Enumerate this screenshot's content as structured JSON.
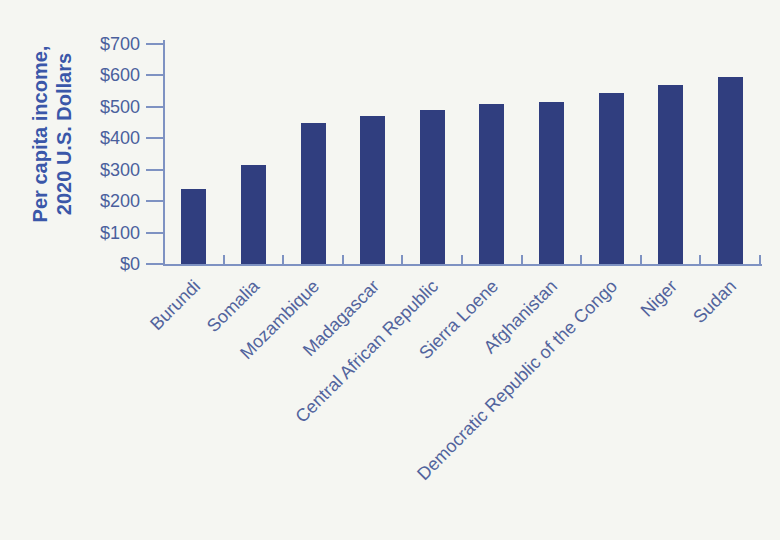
{
  "chart_data": {
    "type": "bar",
    "title": "",
    "xlabel": "",
    "ylabel": "Per capita income, 2020 U.S. Dollars",
    "ylabel_lines": [
      "Per capita income,",
      "2020 U.S. Dollars"
    ],
    "categories": [
      "Burundi",
      "Somalia",
      "Mozambique",
      "Madagascar",
      "Central African Republic",
      "Sierra Loene",
      "Afghanistan",
      "Democratic Republic of the Congo",
      "Niger",
      "Sudan"
    ],
    "values": [
      240,
      315,
      450,
      470,
      490,
      510,
      515,
      545,
      570,
      595
    ],
    "ylim": [
      0,
      700
    ],
    "ytick_step": 100,
    "ytick_labels": [
      "$0",
      "$100",
      "$200",
      "$300",
      "$400",
      "$500",
      "$600",
      "$700"
    ],
    "grid": false,
    "legend": "none",
    "bar_color": "#303e7f",
    "axis_color": "#7e92c2",
    "tick_label_color": "#4a5f9d",
    "xtick_label_color": "#52649d",
    "ylabel_color": "#3a57a9",
    "background_color": "#f5f6f2"
  }
}
